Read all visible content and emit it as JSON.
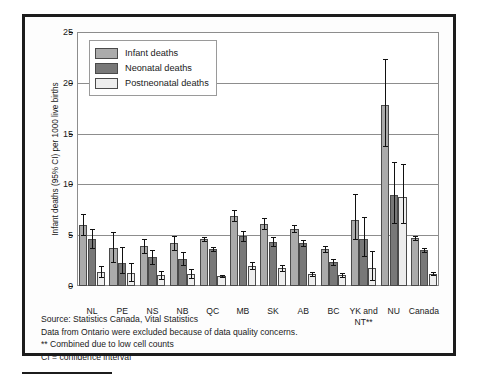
{
  "chart_data": {
    "type": "bar",
    "title": "",
    "xlabel": "",
    "ylabel": "Infant deaths (95% CI) per 1000 live births",
    "ylim": [
      0,
      25
    ],
    "yticks": [
      0,
      5,
      10,
      15,
      20,
      25
    ],
    "grid": true,
    "legend_position": "top-left",
    "categories": [
      "NL",
      "PE",
      "NS",
      "NB",
      "QC",
      "MB",
      "SK",
      "AB",
      "BC",
      "YK and NT**",
      "NU",
      "Canada"
    ],
    "series": [
      {
        "name": "Infant deaths",
        "color": "#ababab",
        "values": [
          6.0,
          3.7,
          3.9,
          4.2,
          4.6,
          6.9,
          6.1,
          5.6,
          3.6,
          6.5,
          17.8,
          4.7
        ],
        "ci_low": [
          5.0,
          2.4,
          3.2,
          3.5,
          4.4,
          6.4,
          5.6,
          5.3,
          3.3,
          4.6,
          13.8,
          4.5
        ],
        "ci_high": [
          7.1,
          5.3,
          4.6,
          4.9,
          4.8,
          7.5,
          6.7,
          6.0,
          3.9,
          9.1,
          22.3,
          4.9
        ]
      },
      {
        "name": "Neonatal deaths",
        "color": "#787878",
        "values": [
          4.6,
          2.3,
          2.85,
          2.7,
          3.6,
          4.9,
          4.3,
          4.2,
          2.4,
          4.6,
          9.0,
          3.5
        ],
        "ci_low": [
          3.7,
          1.3,
          2.2,
          2.1,
          3.4,
          4.4,
          3.9,
          3.9,
          2.1,
          3.0,
          6.2,
          3.3
        ],
        "ci_high": [
          5.6,
          3.8,
          3.5,
          3.3,
          3.8,
          5.4,
          4.8,
          4.5,
          2.7,
          6.8,
          12.2,
          3.7
        ]
      },
      {
        "name": "Postneonatal deaths",
        "color": "#ededed",
        "values": [
          1.4,
          1.25,
          1.1,
          1.15,
          0.95,
          2.0,
          1.8,
          1.2,
          1.05,
          1.8,
          8.8,
          1.2
        ],
        "ci_low": [
          0.9,
          0.5,
          0.7,
          0.75,
          0.85,
          1.7,
          1.5,
          1.0,
          0.85,
          0.6,
          6.2,
          1.1
        ],
        "ci_high": [
          2.0,
          2.3,
          1.5,
          1.7,
          1.1,
          2.4,
          2.1,
          1.4,
          1.3,
          3.4,
          12.0,
          1.4
        ]
      }
    ]
  },
  "legend": {
    "items": [
      {
        "label": "Infant deaths",
        "key": "infant"
      },
      {
        "label": "Neonatal deaths",
        "key": "neonatal"
      },
      {
        "label": "Postneonatal deaths",
        "key": "postneonatal"
      }
    ]
  },
  "notes": [
    "Source: Statistics Canada, Vital Statistics",
    "Data from Ontario were excluded because of data quality concerns.",
    "** Combined due to low cell counts",
    "CI = confidence interval"
  ],
  "colors": {
    "infant": "#ababab",
    "neonatal": "#787878",
    "postneonatal": "#ededed",
    "frame": "#1c1c1c",
    "grid": "#8d8d8d"
  }
}
